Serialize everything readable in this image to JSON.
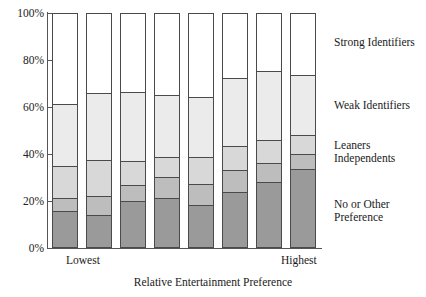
{
  "chart_data": {
    "type": "bar",
    "subtype": "stacked-bar-100-percent",
    "title": "",
    "xlabel": "Relative Entertainment Preference",
    "ylabel": "",
    "ylim": [
      0,
      100
    ],
    "yticks": [
      "0%",
      "20%",
      "40%",
      "60%",
      "80%",
      "100%"
    ],
    "ytick_values": [
      0,
      20,
      40,
      60,
      80,
      100
    ],
    "grid": false,
    "legend_position": "right",
    "categories": [
      "1",
      "2",
      "3",
      "4",
      "5",
      "6",
      "7",
      "8"
    ],
    "category_endpoints": {
      "first": "Lowest",
      "last": "Highest"
    },
    "series": [
      {
        "name": "No or Other Preference",
        "color": "#9a9a9a",
        "values": [
          15.0,
          13.5,
          19.5,
          20.5,
          17.5,
          23.0,
          27.5,
          33.0
        ]
      },
      {
        "name": "Independents",
        "color": "#bdbdbd",
        "values": [
          5.5,
          8.0,
          6.5,
          9.0,
          9.0,
          9.5,
          8.0,
          6.5
        ]
      },
      {
        "name": "Leaners",
        "color": "#d8d8d8",
        "values": [
          14.0,
          15.5,
          10.5,
          8.5,
          11.5,
          10.5,
          10.0,
          8.0
        ]
      },
      {
        "name": "Weak Identifiers",
        "color": "#ebebeb",
        "values": [
          26.5,
          28.5,
          29.5,
          27.0,
          26.0,
          29.0,
          29.5,
          26.0
        ]
      },
      {
        "name": "Strong Identifiers",
        "color": "#ffffff",
        "values": [
          39.0,
          34.5,
          34.0,
          35.0,
          36.0,
          28.0,
          25.0,
          26.5
        ]
      }
    ],
    "cumulative_tops": {
      "no_or_other_preference": [
        15.0,
        13.5,
        19.5,
        20.5,
        17.5,
        23.0,
        27.5,
        33.0
      ],
      "independents": [
        20.5,
        21.5,
        26.0,
        29.5,
        26.5,
        32.5,
        35.5,
        39.5
      ],
      "leaners": [
        34.5,
        37.0,
        36.5,
        38.0,
        38.0,
        43.0,
        45.5,
        47.5
      ],
      "weak_identifiers": [
        61.0,
        65.5,
        66.0,
        65.0,
        64.0,
        72.0,
        75.0,
        73.5
      ],
      "strong_identifiers": [
        100,
        100,
        100,
        100,
        100,
        100,
        100,
        100
      ]
    },
    "legend_labels": [
      "Strong Identifiers",
      "Weak Identifiers",
      "Leaners",
      "Independents",
      "No or Other\nPreference"
    ]
  },
  "axis": {
    "x_title": "Relative Entertainment Preference",
    "x_first_label": "Lowest",
    "x_last_label": "Highest",
    "y_labels": [
      "100%",
      "80%",
      "60%",
      "40%",
      "20%",
      "0%"
    ]
  },
  "legend": {
    "strong_identifiers": "Strong Identifiers",
    "weak_identifiers": "Weak Identifiers",
    "leaners": "Leaners",
    "independents": "Independents",
    "no_or_other_preference_line1": "No or Other",
    "no_or_other_preference_line2": "Preference"
  }
}
